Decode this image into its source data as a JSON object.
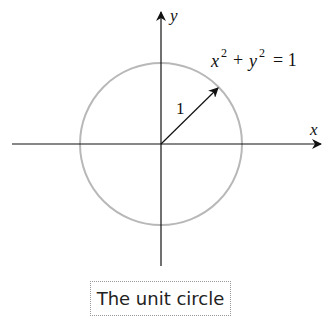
{
  "diagram": {
    "x_axis_label": "x",
    "y_axis_label": "y",
    "equation": {
      "x": "x",
      "y": "y",
      "exp": "2",
      "plus": "+",
      "equals": "= 1"
    },
    "radius_label": "1",
    "caption": "The unit circle",
    "colors": {
      "circle": "#b8b8b8",
      "axes": "#111111"
    }
  }
}
